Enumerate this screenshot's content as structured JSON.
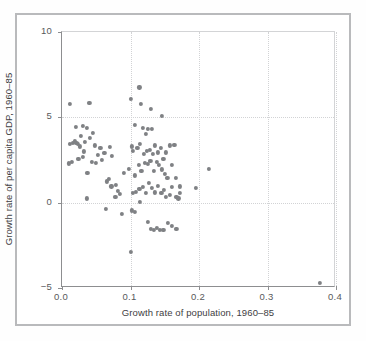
{
  "chart_data": {
    "type": "scatter",
    "title": "",
    "xlabel": "Growth rate of population, 1960–85",
    "ylabel": "Growth rate of per capita GDP, 1960–85",
    "xlim": [
      0.0,
      0.4
    ],
    "ylim": [
      -5,
      10
    ],
    "xticks": [
      "0.0",
      "0.1",
      "0.2",
      "0.3",
      "0.4"
    ],
    "xtick_values": [
      0.0,
      0.1,
      0.2,
      0.3,
      0.4
    ],
    "yticks": [
      "10",
      "5",
      "0",
      "−5"
    ],
    "ytick_values": [
      10,
      5,
      0,
      -5
    ],
    "grid": "dotted gridlines at major ticks",
    "legend": "none",
    "marker_color": "#7f8184",
    "n_points": 116,
    "points": [
      [
        0.012,
        5.8
      ],
      [
        0.04,
        5.85
      ],
      [
        0.101,
        6.1
      ],
      [
        0.113,
        6.75
      ],
      [
        0.115,
        5.8
      ],
      [
        0.13,
        5.5
      ],
      [
        0.146,
        5.1
      ],
      [
        0.02,
        4.45
      ],
      [
        0.03,
        4.5
      ],
      [
        0.036,
        4.4
      ],
      [
        0.045,
        4.1
      ],
      [
        0.107,
        4.55
      ],
      [
        0.118,
        4.4
      ],
      [
        0.122,
        4.05
      ],
      [
        0.126,
        4.3
      ],
      [
        0.131,
        4.3
      ],
      [
        0.012,
        3.45
      ],
      [
        0.016,
        3.5
      ],
      [
        0.019,
        3.6
      ],
      [
        0.021,
        3.5
      ],
      [
        0.023,
        3.45
      ],
      [
        0.026,
        3.3
      ],
      [
        0.028,
        3.9
      ],
      [
        0.032,
        3.0
      ],
      [
        0.034,
        3.55
      ],
      [
        0.041,
        3.8
      ],
      [
        0.048,
        3.35
      ],
      [
        0.052,
        2.8
      ],
      [
        0.056,
        3.2
      ],
      [
        0.062,
        2.9
      ],
      [
        0.07,
        3.25
      ],
      [
        0.073,
        2.75
      ],
      [
        0.102,
        3.3
      ],
      [
        0.104,
        3.05
      ],
      [
        0.11,
        3.2
      ],
      [
        0.114,
        3.45
      ],
      [
        0.119,
        2.85
      ],
      [
        0.124,
        3.05
      ],
      [
        0.128,
        3.1
      ],
      [
        0.133,
        2.85
      ],
      [
        0.136,
        3.35
      ],
      [
        0.14,
        2.95
      ],
      [
        0.144,
        3.2
      ],
      [
        0.148,
        2.55
      ],
      [
        0.152,
        2.95
      ],
      [
        0.158,
        3.35
      ],
      [
        0.164,
        3.4
      ],
      [
        0.01,
        2.3
      ],
      [
        0.015,
        2.4
      ],
      [
        0.024,
        2.55
      ],
      [
        0.03,
        2.7
      ],
      [
        0.037,
        1.75
      ],
      [
        0.044,
        2.4
      ],
      [
        0.05,
        2.35
      ],
      [
        0.058,
        2.5
      ],
      [
        0.065,
        1.25
      ],
      [
        0.068,
        1.4
      ],
      [
        0.072,
        0.95
      ],
      [
        0.079,
        1.05
      ],
      [
        0.085,
        0.5
      ],
      [
        0.09,
        1.75
      ],
      [
        0.098,
        2.0
      ],
      [
        0.106,
        1.6
      ],
      [
        0.112,
        2.2
      ],
      [
        0.116,
        1.85
      ],
      [
        0.121,
        2.35
      ],
      [
        0.125,
        2.25
      ],
      [
        0.129,
        2.45
      ],
      [
        0.134,
        1.85
      ],
      [
        0.138,
        2.4
      ],
      [
        0.142,
        2.2
      ],
      [
        0.146,
        1.95
      ],
      [
        0.15,
        1.7
      ],
      [
        0.154,
        1.45
      ],
      [
        0.16,
        2.2
      ],
      [
        0.166,
        1.45
      ],
      [
        0.172,
        0.95
      ],
      [
        0.196,
        0.85
      ],
      [
        0.214,
        2.0
      ],
      [
        0.036,
        0.25
      ],
      [
        0.078,
        0.35
      ],
      [
        0.082,
        0.7
      ],
      [
        0.104,
        0.55
      ],
      [
        0.108,
        0.65
      ],
      [
        0.113,
        0.8
      ],
      [
        0.118,
        0.9
      ],
      [
        0.122,
        0.55
      ],
      [
        0.127,
        1.15
      ],
      [
        0.131,
        0.85
      ],
      [
        0.136,
        0.6
      ],
      [
        0.14,
        1.0
      ],
      [
        0.145,
        0.55
      ],
      [
        0.149,
        0.75
      ],
      [
        0.152,
        0.35
      ],
      [
        0.157,
        0.45
      ],
      [
        0.161,
        0.9
      ],
      [
        0.167,
        0.35
      ],
      [
        0.17,
        0.25
      ],
      [
        0.172,
        0.55
      ],
      [
        0.064,
        -0.35
      ],
      [
        0.088,
        -0.65
      ],
      [
        0.102,
        -0.45
      ],
      [
        0.106,
        -0.55
      ],
      [
        0.114,
        0.05
      ],
      [
        0.126,
        -1.15
      ],
      [
        0.13,
        -1.55
      ],
      [
        0.134,
        -1.6
      ],
      [
        0.138,
        -1.5
      ],
      [
        0.143,
        -1.6
      ],
      [
        0.148,
        -1.6
      ],
      [
        0.155,
        -1.2
      ],
      [
        0.161,
        -1.35
      ],
      [
        0.167,
        -1.55
      ],
      [
        0.1,
        -2.9
      ],
      [
        0.377,
        -4.7
      ]
    ]
  }
}
